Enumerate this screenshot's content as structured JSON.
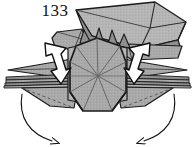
{
  "figure": {
    "step_number": "133",
    "kind": "origami-folding-diagram",
    "caption": "",
    "colors": {
      "paper_front": "#a9a9a9",
      "paper_front_light": "#b6b6b6",
      "paper_shadow": "#8d8d8d",
      "paper_dark": "#7a7a7a",
      "paper_back": "#ffffff",
      "outline": "#1a1a1a",
      "crease": "#5a5a5a",
      "background": "#ffffff",
      "step_number_color": "#111111"
    }
  },
  "parts": {
    "body": {
      "label": "central body panel",
      "shape": "octagonal-hexagon",
      "fill": "#a9a9a9",
      "creases": "radial lines from center"
    },
    "left_wing": {
      "label": "left wing flap",
      "fill": "#a9a9a9"
    },
    "right_wing": {
      "label": "right wing flap",
      "fill": "#a9a9a9"
    },
    "upper_right_flap": {
      "label": "upper right raised flap",
      "fill": "#b6b6b6"
    },
    "left_layers": {
      "label": "left layered strip edges",
      "count": 4
    },
    "right_layers": {
      "label": "right layered strip edges",
      "count": 4
    }
  },
  "annotations": {
    "arrows": [
      {
        "name": "left-fold-arrow",
        "style": "solid-block-arrow",
        "direction": "down",
        "fill": "#ffffff",
        "stroke": "#111111"
      },
      {
        "name": "right-fold-arrow",
        "style": "solid-block-arrow",
        "direction": "down",
        "fill": "#ffffff",
        "stroke": "#111111"
      },
      {
        "name": "bottom-left-curved-arrow",
        "style": "thin-curved-arrow",
        "direction": "sweep-down-right",
        "stroke": "#111111"
      },
      {
        "name": "bottom-right-curved-arrow",
        "style": "thin-curved-arrow",
        "direction": "sweep-down-left",
        "stroke": "#111111"
      }
    ]
  }
}
